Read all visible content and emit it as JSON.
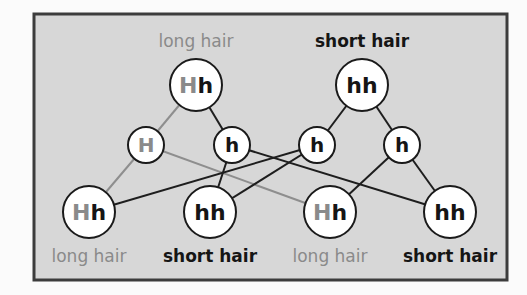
{
  "colors": {
    "background": "#d7d7d7",
    "border": "#3c3c3c",
    "dominant": "#8a8a8a",
    "recessive": "#151515",
    "node_fill": "#ffffff",
    "line_dominant": "#8e8e8e",
    "line_recessive": "#1e1e1e"
  },
  "parents": [
    {
      "id": "p1",
      "genotype": [
        "H",
        "h"
      ],
      "phenotype": "long hair",
      "phenotype_type": "dominant"
    },
    {
      "id": "p2",
      "genotype": [
        "h",
        "h"
      ],
      "phenotype": "short hair",
      "phenotype_type": "recessive"
    }
  ],
  "gametes": [
    {
      "id": "g1",
      "allele": "H",
      "from": "p1",
      "type": "dominant"
    },
    {
      "id": "g2",
      "allele": "h",
      "from": "p1",
      "type": "recessive"
    },
    {
      "id": "g3",
      "allele": "h",
      "from": "p2",
      "type": "recessive"
    },
    {
      "id": "g4",
      "allele": "h",
      "from": "p2",
      "type": "recessive"
    }
  ],
  "offspring": [
    {
      "id": "o1",
      "genotype": [
        "H",
        "h"
      ],
      "phenotype": "long hair",
      "phenotype_type": "dominant"
    },
    {
      "id": "o2",
      "genotype": [
        "h",
        "h"
      ],
      "phenotype": "short hair",
      "phenotype_type": "recessive"
    },
    {
      "id": "o3",
      "genotype": [
        "H",
        "h"
      ],
      "phenotype": "long hair",
      "phenotype_type": "dominant"
    },
    {
      "id": "o4",
      "genotype": [
        "h",
        "h"
      ],
      "phenotype": "short hair",
      "phenotype_type": "recessive"
    }
  ],
  "edges": [
    {
      "from": "p1",
      "to": "g1",
      "type": "dominant"
    },
    {
      "from": "p1",
      "to": "g2",
      "type": "recessive"
    },
    {
      "from": "p2",
      "to": "g3",
      "type": "recessive"
    },
    {
      "from": "p2",
      "to": "g4",
      "type": "recessive"
    },
    {
      "from": "g1",
      "to": "o1",
      "type": "dominant"
    },
    {
      "from": "g1",
      "to": "o3",
      "type": "dominant"
    },
    {
      "from": "g2",
      "to": "o2",
      "type": "recessive"
    },
    {
      "from": "g2",
      "to": "o4",
      "type": "recessive"
    },
    {
      "from": "g3",
      "to": "o1",
      "type": "recessive"
    },
    {
      "from": "g3",
      "to": "o2",
      "type": "recessive"
    },
    {
      "from": "g4",
      "to": "o3",
      "type": "recessive"
    },
    {
      "from": "g4",
      "to": "o4",
      "type": "recessive"
    }
  ]
}
